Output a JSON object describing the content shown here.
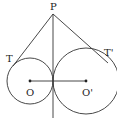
{
  "diagram": {
    "type": "geometry",
    "points": {
      "P": {
        "label": "P",
        "x": 53,
        "y": 14
      },
      "T": {
        "label": "T",
        "x": 15,
        "y": 63
      },
      "T_prime": {
        "label": "T'",
        "x": 105,
        "y": 61
      },
      "O": {
        "label": "O",
        "x": 30,
        "y": 81
      },
      "O_prime": {
        "label": "O'",
        "x": 86,
        "y": 81
      }
    },
    "circles": [
      {
        "center": "O",
        "cx": 30,
        "cy": 81,
        "r": 23
      },
      {
        "center": "O_prime",
        "cx": 86,
        "cy": 81,
        "r": 33
      }
    ],
    "segments": [
      {
        "from": "P",
        "to": "T"
      },
      {
        "from": "P",
        "to": "T_prime"
      },
      {
        "from": "O",
        "to": "O_prime"
      }
    ],
    "common_tangent": {
      "x": 53,
      "y1": 14,
      "y2": 118
    },
    "colors": {
      "stroke": "#333333",
      "background": "#ffffff"
    }
  }
}
